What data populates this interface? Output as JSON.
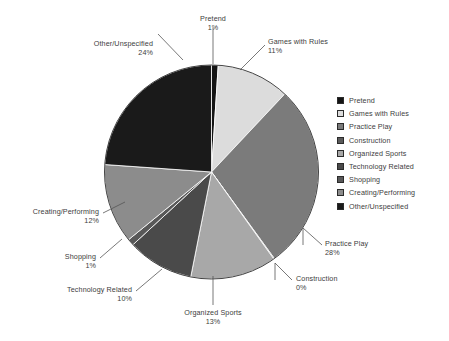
{
  "chart_data": {
    "type": "pie",
    "title": "",
    "legend_position": "right",
    "grid": false,
    "categories": [
      "Pretend",
      "Games with Rules",
      "Practice Play",
      "Construction",
      "Organized Sports",
      "Technology Related",
      "Shopping",
      "Creating/Performing",
      "Other/Unspecified"
    ],
    "values": [
      1,
      11,
      28,
      0,
      13,
      10,
      1,
      12,
      24
    ],
    "value_labels": [
      "1%",
      "11%",
      "28%",
      "0%",
      "13%",
      "10%",
      "1%",
      "12%",
      "24%"
    ],
    "colors": [
      "#141414",
      "#dcdcdc",
      "#7b7b7b",
      "#5a5a5a",
      "#a8a8a8",
      "#4a4a4a",
      "#585858",
      "#8c8c8c",
      "#1a1a1a"
    ],
    "slices": [
      {
        "name": "Pretend",
        "value": 1,
        "label": "Pretend",
        "pct_label": "1%",
        "color": "#141414",
        "start_angle": 0,
        "end_angle": 3.6
      },
      {
        "name": "Games with Rules",
        "value": 11,
        "label": "Games with Rules",
        "pct_label": "11%",
        "color": "#dcdcdc",
        "start_angle": 3.6,
        "end_angle": 43.2
      },
      {
        "name": "Practice Play",
        "value": 28,
        "label": "Practice Play",
        "pct_label": "28%",
        "color": "#7b7b7b",
        "start_angle": 43.2,
        "end_angle": 144.0
      },
      {
        "name": "Construction",
        "value": 0,
        "label": "Construction",
        "pct_label": "0%",
        "color": "#5a5a5a",
        "start_angle": 144.0,
        "end_angle": 144.4
      },
      {
        "name": "Organized Sports",
        "value": 13,
        "label": "Organized Sports",
        "pct_label": "13%",
        "color": "#a8a8a8",
        "start_angle": 144.4,
        "end_angle": 191.2
      },
      {
        "name": "Technology Related",
        "value": 10,
        "label": "Technology Related",
        "pct_label": "10%",
        "color": "#4a4a4a",
        "start_angle": 191.2,
        "end_angle": 227.2
      },
      {
        "name": "Shopping",
        "value": 1,
        "label": "Shopping",
        "pct_label": "1%",
        "color": "#585858",
        "start_angle": 227.2,
        "end_angle": 230.8
      },
      {
        "name": "Creating/Performing",
        "value": 12,
        "label": "Creating/Performing",
        "pct_label": "12%",
        "color": "#8c8c8c",
        "start_angle": 230.8,
        "end_angle": 274.0
      },
      {
        "name": "Other/Unspecified",
        "value": 24,
        "label": "Other/Unspecified",
        "pct_label": "24%",
        "color": "#1a1a1a",
        "start_angle": 274.0,
        "end_angle": 360.0
      }
    ]
  },
  "legend": {
    "items": [
      {
        "label": "Pretend",
        "color": "#141414"
      },
      {
        "label": "Games with Rules",
        "color": "#dcdcdc"
      },
      {
        "label": "Practice Play",
        "color": "#7b7b7b"
      },
      {
        "label": "Construction",
        "color": "#5a5a5a"
      },
      {
        "label": "Organized Sports",
        "color": "#a8a8a8"
      },
      {
        "label": "Technology Related",
        "color": "#4a4a4a"
      },
      {
        "label": "Shopping",
        "color": "#585858"
      },
      {
        "label": "Creating/Performing",
        "color": "#8c8c8c"
      },
      {
        "label": "Other/Unspecified",
        "color": "#1a1a1a"
      }
    ]
  },
  "callouts": [
    {
      "key": "pretend",
      "name": "Pretend",
      "pct": "1%"
    },
    {
      "key": "games-with-rules",
      "name": "Games with Rules",
      "pct": "11%"
    },
    {
      "key": "practice-play",
      "name": "Practice Play",
      "pct": "28%"
    },
    {
      "key": "construction",
      "name": "Construction",
      "pct": "0%"
    },
    {
      "key": "organized-sports",
      "name": "Organized Sports",
      "pct": "13%"
    },
    {
      "key": "technology-related",
      "name": "Technology Related",
      "pct": "10%"
    },
    {
      "key": "shopping",
      "name": "Shopping",
      "pct": "1%"
    },
    {
      "key": "creating-performing",
      "name": "Creating/Performing",
      "pct": "12%"
    },
    {
      "key": "other-unspecified",
      "name": "Other/Unspecified",
      "pct": "24%"
    }
  ]
}
